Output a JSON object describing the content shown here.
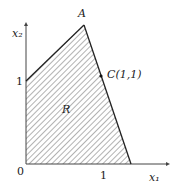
{
  "diagram": {
    "region_label": "R",
    "point_a": "A",
    "point_c": "C(1,1)",
    "axis_x": "x₁",
    "axis_y": "x₂",
    "origin": "0",
    "tick_x": "1",
    "tick_y": "1",
    "colors": {
      "line": "#222222",
      "hatch": "#555555",
      "axis": "#444444"
    }
  }
}
